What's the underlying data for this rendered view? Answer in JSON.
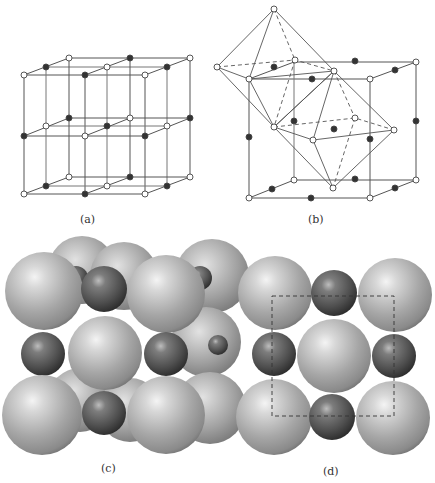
{
  "figure": {
    "panels": [
      {
        "id": "a",
        "label": "(a)",
        "description": "simple cubic lattice of alternating ions (2x2x2 cells)"
      },
      {
        "id": "b",
        "label": "(b)",
        "description": "unit cell with octahedral coordination polyhedra"
      },
      {
        "id": "c",
        "label": "(c)",
        "description": "space-filling sphere model, perspective view"
      },
      {
        "id": "d",
        "label": "(d)",
        "description": "space-filling sphere model, face view with dashed unit cell"
      }
    ]
  },
  "colors": {
    "line": "#555555",
    "open_atom_fill": "#ffffff",
    "filled_atom": "#333333",
    "large_sphere_light": "#e4e4e4",
    "large_sphere_mid": "#a8a8a8",
    "large_sphere_dark": "#6e6e6e",
    "small_sphere_light": "#b5b5b5",
    "small_sphere_mid": "#666666",
    "small_sphere_dark": "#2e2e2e"
  }
}
